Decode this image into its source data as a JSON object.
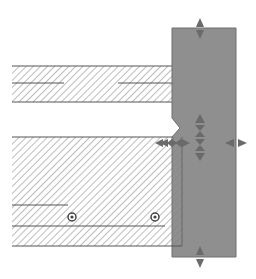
{
  "diagram": {
    "colors": {
      "background": "#ffffff",
      "panel_fill": "#8f8f8f",
      "panel_stroke": "#6e6e6e",
      "hatch": "#7a7a7a",
      "line": "#555555",
      "handle": "#6a6a6a",
      "bolt": "#444444"
    },
    "panel": {
      "x": 172,
      "y": 28,
      "w": 64,
      "h": 229
    },
    "upper_slab": {
      "x": 12,
      "y": 66,
      "w": 160,
      "h": 36,
      "mid_line_y": 83,
      "mid_left": [
        12,
        64
      ],
      "mid_right": [
        118,
        172
      ]
    },
    "lower_slab": {
      "x": 12,
      "y": 137,
      "w": 170,
      "h": 109,
      "line1": {
        "y": 205,
        "x1": 12,
        "x2": 68
      },
      "line2": {
        "y": 226,
        "x1": 12,
        "x2": 165
      }
    },
    "bolts": [
      {
        "cx": 72,
        "cy": 217
      },
      {
        "cx": 155,
        "cy": 217
      }
    ],
    "handles": [
      {
        "name": "top-resize-handle",
        "cx": 200,
        "cy": 28,
        "dir": "vertical"
      },
      {
        "name": "bottom-resize-handle",
        "cx": 200,
        "cy": 257,
        "dir": "vertical"
      },
      {
        "name": "right-resize-handle",
        "cx": 236,
        "cy": 143,
        "dir": "horizontal"
      },
      {
        "name": "left-resize-handle",
        "cx": 172,
        "cy": 143,
        "dir": "horizontal"
      },
      {
        "name": "center-move-handle",
        "cx": 200,
        "cy": 138,
        "dir": "vertical"
      }
    ]
  }
}
